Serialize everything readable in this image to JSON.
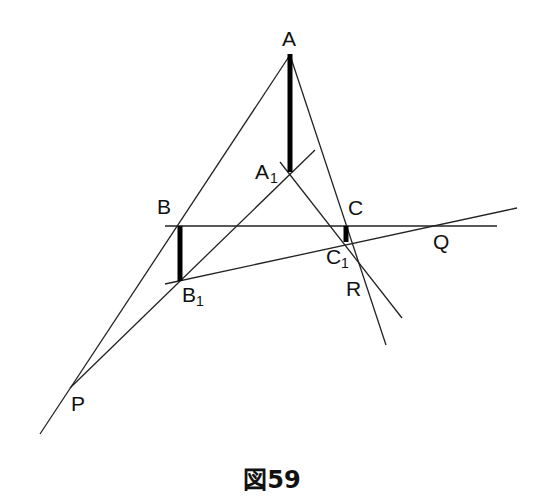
{
  "figure": {
    "caption": "図59",
    "points": {
      "A": {
        "label": "A",
        "x": 290,
        "y": 55
      },
      "A1": {
        "label": "A",
        "sub": "1",
        "x": 290,
        "y": 172
      },
      "B": {
        "label": "B",
        "x": 180,
        "y": 226
      },
      "B1": {
        "label": "B",
        "sub": "1",
        "x": 180,
        "y": 281
      },
      "C": {
        "label": "C",
        "x": 346,
        "y": 226
      },
      "C1": {
        "label": "C",
        "sub": "1",
        "x": 346,
        "y": 242
      },
      "P": {
        "label": "P",
        "x": 70,
        "y": 388
      },
      "Q": {
        "label": "Q",
        "x": 441,
        "y": 224
      },
      "R": {
        "label": "R",
        "x": 360,
        "y": 287
      }
    },
    "labels": {
      "A": "A",
      "A1": "A",
      "B": "B",
      "B1": "B",
      "C": "C",
      "C1": "C",
      "P": "P",
      "Q": "Q",
      "R": "R",
      "sub1": "1"
    },
    "colors": {
      "line": "#222222",
      "thick": "#000000",
      "background": "#ffffff"
    }
  }
}
